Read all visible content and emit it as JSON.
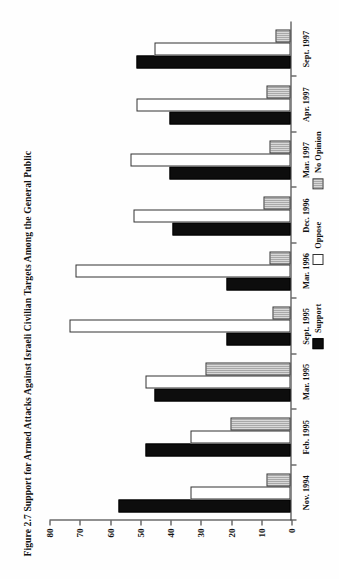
{
  "figure": {
    "title": "Figure 2.7  Support for Armed Attacks Against Israeli Civilian Targets Among the General Public"
  },
  "chart_data": {
    "type": "bar",
    "orientation": "horizontal",
    "title": "Figure 2.7  Support for Armed Attacks Against Israeli Civilian Targets Among the General Public",
    "xlabel": "",
    "ylabel": "",
    "ylim": [
      0,
      80
    ],
    "yticks": [
      0,
      10,
      20,
      30,
      40,
      50,
      60,
      70,
      80
    ],
    "ytick_labels": [
      "0",
      "10",
      "20",
      "30",
      "40",
      "50",
      "60",
      "70",
      "80"
    ],
    "grid": false,
    "legend_position": "bottom",
    "categories": [
      "Nov. 1994",
      "Feb. 1995",
      "Mar. 1995",
      "Sept. 1995",
      "Mar. 1996",
      "Dec. 1996",
      "Mar. 1997",
      "Apr. 1997",
      "Sept. 1997"
    ],
    "series": [
      {
        "name": "Support",
        "color": "#0d0d0d",
        "values": [
          57,
          48,
          45,
          21,
          21,
          39,
          40,
          40,
          51
        ]
      },
      {
        "name": "Oppose",
        "color": "#ffffff",
        "values": [
          33,
          33,
          48,
          73,
          71,
          52,
          53,
          51,
          45
        ]
      },
      {
        "name": "No Opinion",
        "color": "#b0b0b0",
        "values": [
          8,
          20,
          28,
          6,
          7,
          9,
          7,
          8,
          5
        ]
      }
    ]
  },
  "legend": {
    "items": [
      {
        "label": "Support"
      },
      {
        "label": "Oppose"
      },
      {
        "label": "No Opinion"
      }
    ]
  }
}
